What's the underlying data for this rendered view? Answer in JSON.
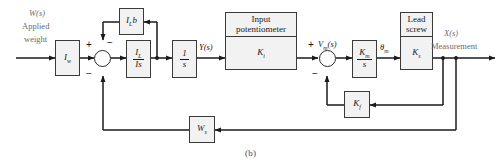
{
  "figure": {
    "caption": "(b)",
    "type": "control-system-block-diagram"
  },
  "colors": {
    "block_fill": "#f2f2f2",
    "block_border": "#3a3a3a",
    "wire": "#1a1a1a",
    "label_gray": "#6b6b6b",
    "background": "#ffffff"
  },
  "signals": {
    "input_transform": "W(s)",
    "input_line1": "Applied",
    "input_line2": "weight",
    "after_integrator": "Y(s)",
    "motor_voltage": "V",
    "motor_voltage_sub": "m",
    "motor_voltage_tail": "(s)",
    "motor_angle": "θ",
    "motor_angle_sub": "m",
    "output_transform": "X(s)",
    "output_label": "Measurement"
  },
  "blocks": [
    {
      "id": "load-weight-gain",
      "name": "weight-gain-block",
      "gain": "I",
      "gain_sub": "w"
    },
    {
      "id": "damping-feedback",
      "name": "damping-feedback-block",
      "gain": "I",
      "gain_sub": "L",
      "gain_tail": "b"
    },
    {
      "id": "inertia-transfer",
      "name": "inertia-transfer-block",
      "numerator": "I",
      "numerator_sub": "L",
      "denominator": "Is"
    },
    {
      "id": "integrator",
      "name": "integrator-block",
      "numerator": "1",
      "denominator": "s"
    },
    {
      "id": "input-potentiometer",
      "name": "input-potentiometer-block",
      "title_line1": "Input",
      "title_line2": "potentiometer",
      "gain": "K",
      "gain_sub": "i"
    },
    {
      "id": "motor",
      "name": "motor-block",
      "numerator": "K",
      "numerator_sub": "m",
      "denominator": "s"
    },
    {
      "id": "lead-screw",
      "name": "lead-screw-block",
      "title_line1": "Lead",
      "title_line2": "screw",
      "gain": "K",
      "gain_sub": "s"
    },
    {
      "id": "tachometer-feedback",
      "name": "tachometer-feedback-block",
      "gain": "K",
      "gain_sub": "f"
    },
    {
      "id": "output-sensor-feedback",
      "name": "output-sensor-feedback-block",
      "gain": "W",
      "gain_sub": "s"
    }
  ],
  "summing_junctions": [
    {
      "id": "sum-left",
      "name": "summing-junction-left",
      "signs": {
        "west": "+",
        "north": "−",
        "south": "−"
      }
    },
    {
      "id": "sum-right",
      "name": "summing-junction-right",
      "signs": {
        "west": "+",
        "south": "−"
      }
    }
  ]
}
